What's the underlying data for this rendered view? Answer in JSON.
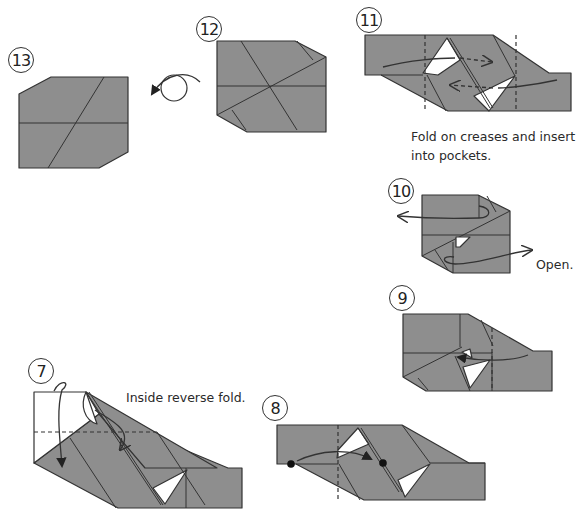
{
  "diagram": {
    "colors": {
      "paper": "#8e8e8e",
      "line": "#333333",
      "background": "#ffffff"
    },
    "steps": [
      {
        "number": "⑬",
        "label": "13",
        "caption": ""
      },
      {
        "number": "⑫",
        "label": "12",
        "caption": "",
        "action": "turn-over"
      },
      {
        "number": "⑪",
        "label": "11",
        "caption": "Fold on creases and insert into pockets."
      },
      {
        "number": "⑩",
        "label": "10",
        "caption": "Open."
      },
      {
        "number": "⑨",
        "label": "9",
        "caption": ""
      },
      {
        "number": "⑧",
        "label": "8",
        "caption": ""
      },
      {
        "number": "⑦",
        "label": "7",
        "caption": "Inside reverse fold."
      }
    ]
  }
}
